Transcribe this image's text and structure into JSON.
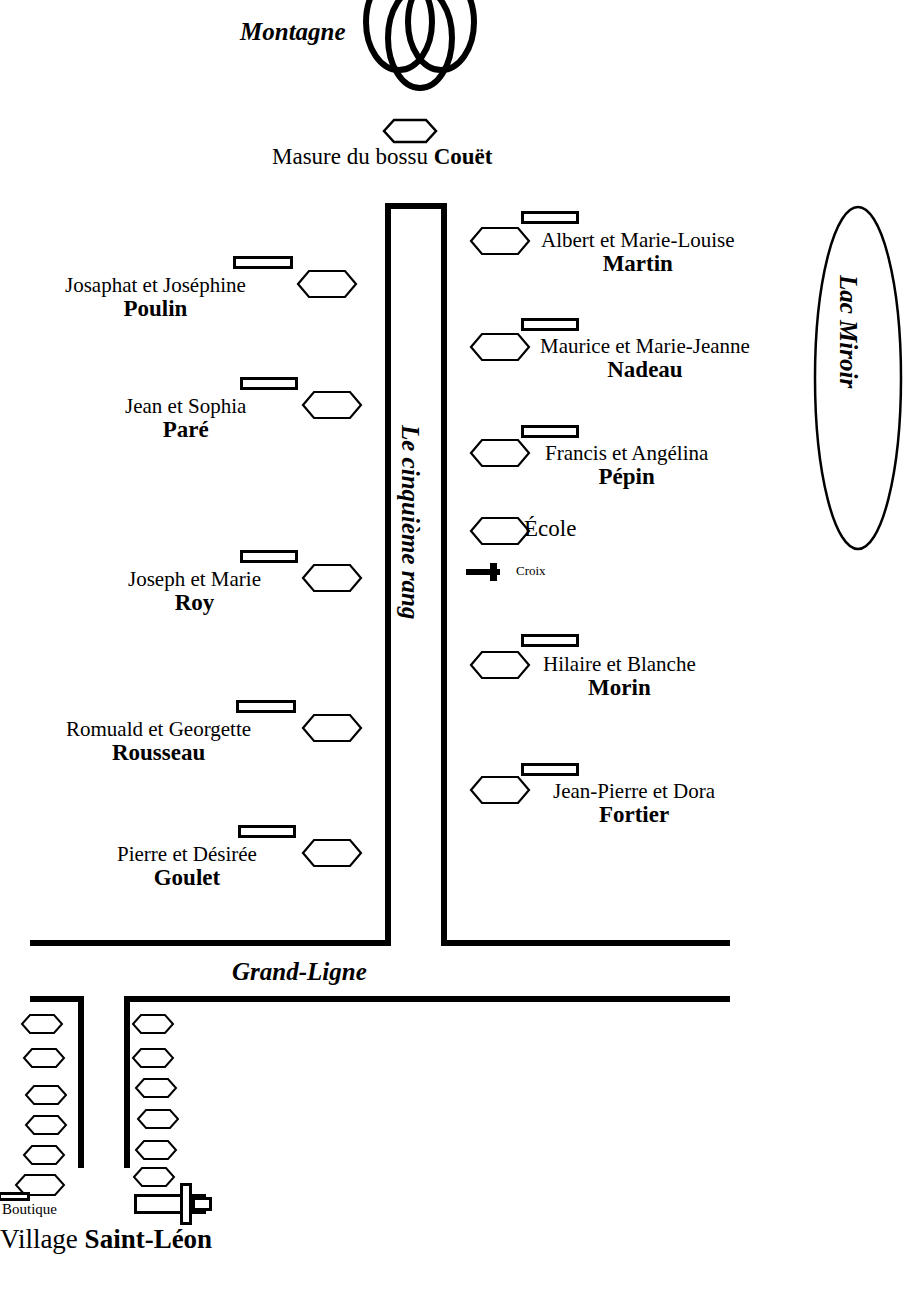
{
  "map": {
    "title": "Carte du cinquième rang — Village Saint-Léon",
    "landmarks": {
      "montagne": "Montagne",
      "masure_prefix": "Masure du bossu ",
      "masure_name": "Couët",
      "lac": "Lac Miroir",
      "rang": "Le cinquième rang",
      "grand_ligne": "Grand-Ligne",
      "ecole": "École",
      "croix": "Croix",
      "boutique": "Boutique",
      "village_prefix": "Village ",
      "village_name": "Saint-Léon"
    },
    "farms_left": [
      {
        "given": "Josaphat et Joséphine",
        "family": "Poulin"
      },
      {
        "given": "Jean et Sophia",
        "family": "Paré"
      },
      {
        "given": "Joseph et Marie",
        "family": "Roy"
      },
      {
        "given": "Romuald et Georgette",
        "family": "Rousseau"
      },
      {
        "given": "Pierre et Désirée",
        "family": "Goulet"
      }
    ],
    "farms_right": [
      {
        "given": "Albert et Marie-Louise",
        "family": "Martin"
      },
      {
        "given": "Maurice et Marie-Jeanne",
        "family": "Nadeau"
      },
      {
        "given": "Francis et Angélina",
        "family": "Pépin"
      },
      {
        "given": "Hilaire et Blanche",
        "family": "Morin"
      },
      {
        "given": "Jean-Pierre et Dora",
        "family": "Fortier"
      }
    ],
    "colors": {
      "ink": "#000000",
      "paper": "#ffffff"
    },
    "counts": {
      "village_houses_west": 6,
      "village_houses_east": 6
    }
  }
}
